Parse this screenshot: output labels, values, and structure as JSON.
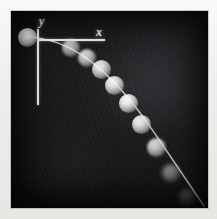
{
  "figure": {
    "kind": "stroboscopic-photograph",
    "plate": {
      "background_color": "#17171a",
      "border_color": "#e9e8e5",
      "left": 11,
      "top": 11,
      "width": 197,
      "height": 197
    }
  },
  "axes": {
    "origin": {
      "x": 26,
      "y": 28
    },
    "y_axis": {
      "label": "y",
      "label_x": 28,
      "label_y": 4,
      "length": 76,
      "color": "#e8e8e4"
    },
    "x_axis": {
      "label": "x",
      "label_x": 85,
      "label_y": 15,
      "length": 68,
      "color": "#e8e8e4"
    }
  },
  "trajectory": {
    "curve_color": "#dcdcd6",
    "curve_width": 1.1,
    "path": "M 8 25 C 34 25.5 58 34 78 49 C 98 64 120 88 140 117 C 158 143 176 170 193 195",
    "description": "parabolic path falling to the lower-right"
  },
  "balls": [
    {
      "cx": 16,
      "cy": 26,
      "r": 9.5,
      "brightness": 1.0,
      "blur": "sharp"
    },
    {
      "cx": 60,
      "cy": 37,
      "r": 9.0,
      "brightness": 0.7,
      "blur": "soft"
    },
    {
      "cx": 76,
      "cy": 47,
      "r": 9.0,
      "brightness": 0.8,
      "blur": "soft"
    },
    {
      "cx": 90,
      "cy": 58,
      "r": 9.5,
      "brightness": 0.88,
      "blur": "sharp"
    },
    {
      "cx": 103,
      "cy": 74,
      "r": 9.5,
      "brightness": 0.92,
      "blur": "sharp"
    },
    {
      "cx": 117,
      "cy": 92,
      "r": 9.5,
      "brightness": 0.95,
      "blur": "sharp"
    },
    {
      "cx": 130,
      "cy": 113,
      "r": 9.5,
      "brightness": 0.9,
      "blur": "sharp"
    },
    {
      "cx": 145,
      "cy": 136,
      "r": 9.5,
      "brightness": 0.8,
      "blur": "soft"
    },
    {
      "cx": 160,
      "cy": 162,
      "r": 9.0,
      "brightness": 0.45,
      "blur": "softer"
    },
    {
      "cx": 176,
      "cy": 186,
      "r": 8.5,
      "brightness": 0.22,
      "blur": "softer"
    }
  ]
}
